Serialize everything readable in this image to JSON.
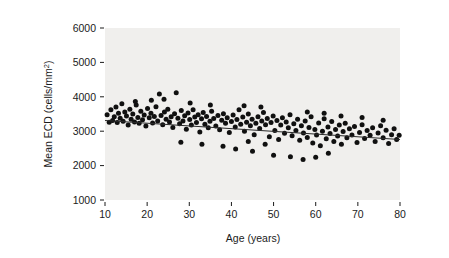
{
  "figure": {
    "background_color": "#ffffff",
    "panel_color": "#f0efed",
    "point_color": "#101010",
    "line_color": "#2b2b2b"
  },
  "axis": {
    "y_label_text": "Mean ECD (cells/mm",
    "y_label_sup": "2",
    "y_label_close": ")",
    "x_label": "Age (years)"
  },
  "chart_data": {
    "type": "scatter",
    "title": "",
    "xlabel": "Age (years)",
    "ylabel": "Mean ECD (cells/mm2)",
    "xlim": [
      10,
      80
    ],
    "ylim": [
      1000,
      6000
    ],
    "xticks": [
      10,
      20,
      30,
      40,
      50,
      60,
      70,
      80
    ],
    "yticks": [
      1000,
      2000,
      3000,
      4000,
      5000,
      6000
    ],
    "xtick_labels": [
      "10",
      "20",
      "30",
      "40",
      "50",
      "60",
      "70",
      "80"
    ],
    "ytick_labels": [
      "1000",
      "2000",
      "3000",
      "4000",
      "5000",
      "6000"
    ],
    "grid": false,
    "legend": false,
    "marker_size": 5,
    "trendline": {
      "type": "linear",
      "x_start": 10,
      "y_start": 3310,
      "x_end": 80,
      "y_end": 2760
    },
    "points": [
      [
        10.5,
        3480
      ],
      [
        11.0,
        3260
      ],
      [
        11.4,
        3620
      ],
      [
        11.8,
        3310
      ],
      [
        12.2,
        3420
      ],
      [
        12.6,
        3700
      ],
      [
        12.9,
        3250
      ],
      [
        13.2,
        3520
      ],
      [
        13.6,
        3380
      ],
      [
        14.0,
        3800
      ],
      [
        14.3,
        3290
      ],
      [
        14.7,
        3560
      ],
      [
        15.1,
        3440
      ],
      [
        15.5,
        3180
      ],
      [
        15.9,
        3640
      ],
      [
        16.2,
        3350
      ],
      [
        16.6,
        3500
      ],
      [
        17.0,
        3270
      ],
      [
        17.4,
        3760
      ],
      [
        17.8,
        3400
      ],
      [
        18.1,
        3230
      ],
      [
        18.5,
        3580
      ],
      [
        18.9,
        3330
      ],
      [
        19.3,
        3470
      ],
      [
        19.7,
        3150
      ],
      [
        20.1,
        3660
      ],
      [
        20.5,
        3390
      ],
      [
        20.9,
        3520
      ],
      [
        21.3,
        3240
      ],
      [
        21.7,
        3430
      ],
      [
        22.1,
        3710
      ],
      [
        22.5,
        3300
      ],
      [
        22.9,
        4080
      ],
      [
        23.3,
        3460
      ],
      [
        23.7,
        3190
      ],
      [
        24.1,
        3560
      ],
      [
        24.5,
        3350
      ],
      [
        24.9,
        3640
      ],
      [
        25.3,
        3270
      ],
      [
        25.7,
        3420
      ],
      [
        26.1,
        3110
      ],
      [
        26.5,
        3510
      ],
      [
        26.9,
        4120
      ],
      [
        27.3,
        3380
      ],
      [
        27.7,
        3220
      ],
      [
        28.1,
        3600
      ],
      [
        28.5,
        3300
      ],
      [
        28.9,
        3450
      ],
      [
        29.3,
        3060
      ],
      [
        29.7,
        3530
      ],
      [
        30.1,
        3340
      ],
      [
        30.5,
        3180
      ],
      [
        30.9,
        3620
      ],
      [
        31.3,
        3410
      ],
      [
        31.7,
        3250
      ],
      [
        32.1,
        3480
      ],
      [
        32.5,
        2980
      ],
      [
        32.9,
        3360
      ],
      [
        33.3,
        3540
      ],
      [
        33.7,
        3200
      ],
      [
        34.1,
        3430
      ],
      [
        34.5,
        3100
      ],
      [
        34.9,
        3290
      ],
      [
        35.3,
        3580
      ],
      [
        35.8,
        3370
      ],
      [
        36.3,
        3150
      ],
      [
        36.8,
        3460
      ],
      [
        37.2,
        3040
      ],
      [
        37.7,
        3320
      ],
      [
        38.1,
        3510
      ],
      [
        38.6,
        3230
      ],
      [
        39.0,
        3390
      ],
      [
        39.5,
        2960
      ],
      [
        40.0,
        3280
      ],
      [
        40.4,
        3470
      ],
      [
        40.9,
        3120
      ],
      [
        41.3,
        3340
      ],
      [
        41.8,
        3620
      ],
      [
        42.2,
        3200
      ],
      [
        42.7,
        3410
      ],
      [
        43.1,
        3000
      ],
      [
        43.6,
        3260
      ],
      [
        44.0,
        3500
      ],
      [
        44.5,
        3160
      ],
      [
        44.9,
        3350
      ],
      [
        45.4,
        2900
      ],
      [
        45.8,
        3230
      ],
      [
        46.3,
        3420
      ],
      [
        46.7,
        3080
      ],
      [
        47.2,
        3300
      ],
      [
        47.6,
        3540
      ],
      [
        48.1,
        3190
      ],
      [
        48.5,
        3370
      ],
      [
        49.0,
        2840
      ],
      [
        49.4,
        3250
      ],
      [
        49.9,
        3440
      ],
      [
        50.3,
        3020
      ],
      [
        50.8,
        3310
      ],
      [
        51.2,
        2760
      ],
      [
        51.7,
        3180
      ],
      [
        52.1,
        3390
      ],
      [
        52.6,
        2940
      ],
      [
        53.0,
        3270
      ],
      [
        53.5,
        3100
      ],
      [
        53.9,
        3480
      ],
      [
        54.4,
        2870
      ],
      [
        54.8,
        3220
      ],
      [
        55.3,
        3020
      ],
      [
        55.7,
        3350
      ],
      [
        56.2,
        2740
      ],
      [
        56.6,
        3160
      ],
      [
        57.1,
        2950
      ],
      [
        57.5,
        3300
      ],
      [
        58.0,
        2820
      ],
      [
        58.4,
        3110
      ],
      [
        58.9,
        3420
      ],
      [
        59.3,
        2660
      ],
      [
        59.8,
        3050
      ],
      [
        60.2,
        2890
      ],
      [
        60.7,
        3240
      ],
      [
        61.1,
        2580
      ],
      [
        61.6,
        3000
      ],
      [
        62.0,
        3360
      ],
      [
        62.5,
        2780
      ],
      [
        62.9,
        3120
      ],
      [
        63.4,
        2930
      ],
      [
        63.8,
        3280
      ],
      [
        64.3,
        2700
      ],
      [
        64.7,
        3050
      ],
      [
        65.2,
        2860
      ],
      [
        65.6,
        3180
      ],
      [
        66.1,
        2620
      ],
      [
        66.5,
        2990
      ],
      [
        67.0,
        3230
      ],
      [
        67.4,
        2810
      ],
      [
        68.0,
        3070
      ],
      [
        68.6,
        2890
      ],
      [
        69.2,
        3140
      ],
      [
        69.8,
        2670
      ],
      [
        70.4,
        2960
      ],
      [
        71.0,
        3190
      ],
      [
        71.6,
        2790
      ],
      [
        72.2,
        3020
      ],
      [
        72.9,
        2880
      ],
      [
        73.5,
        3100
      ],
      [
        74.1,
        2700
      ],
      [
        74.8,
        2950
      ],
      [
        75.4,
        3160
      ],
      [
        76.0,
        2810
      ],
      [
        76.7,
        3030
      ],
      [
        77.3,
        2640
      ],
      [
        78.0,
        2900
      ],
      [
        78.6,
        3070
      ],
      [
        79.2,
        2760
      ],
      [
        79.8,
        2880
      ],
      [
        21.0,
        3900
      ],
      [
        24.0,
        3930
      ],
      [
        17.2,
        3860
      ],
      [
        30.2,
        3820
      ],
      [
        35.0,
        3760
      ],
      [
        43.0,
        3740
      ],
      [
        47.0,
        3700
      ],
      [
        58.0,
        3560
      ],
      [
        62.0,
        3520
      ],
      [
        66.0,
        3440
      ],
      [
        71.0,
        3400
      ],
      [
        76.0,
        3320
      ],
      [
        28.0,
        2680
      ],
      [
        33.0,
        2620
      ],
      [
        38.0,
        2560
      ],
      [
        41.0,
        2480
      ],
      [
        45.0,
        2420
      ],
      [
        50.0,
        2300
      ],
      [
        54.0,
        2260
      ],
      [
        57.0,
        2180
      ],
      [
        60.0,
        2240
      ],
      [
        63.0,
        2360
      ],
      [
        44.0,
        2700
      ],
      [
        48.0,
        2620
      ]
    ]
  }
}
